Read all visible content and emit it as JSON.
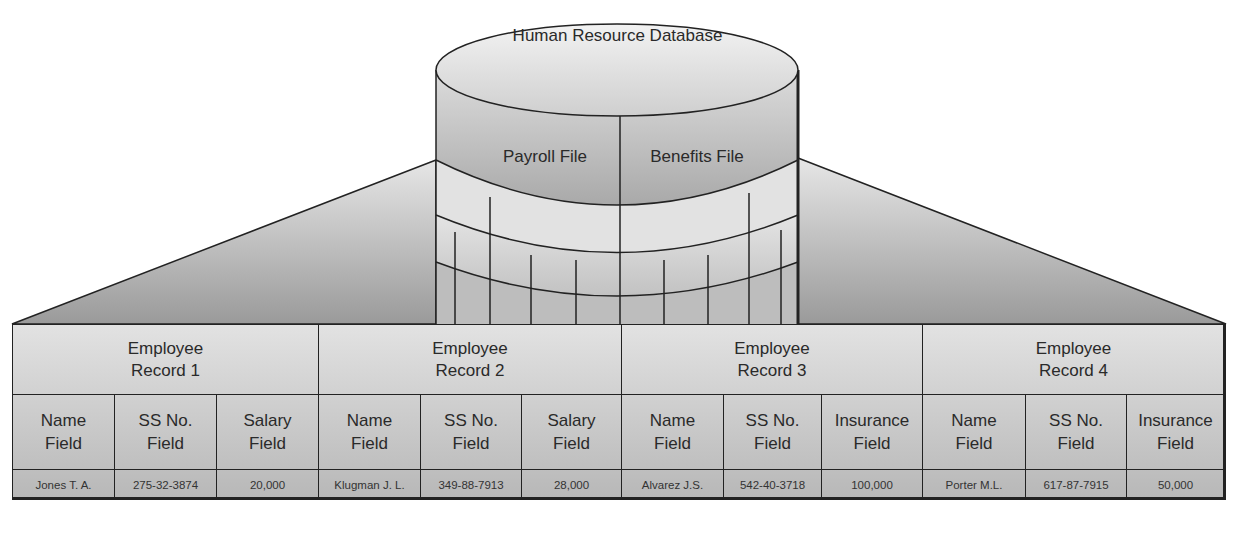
{
  "database": {
    "title": "Human Resource Database",
    "files": [
      {
        "label": "Payroll File"
      },
      {
        "label": "Benefits File"
      }
    ]
  },
  "records": [
    {
      "title_line1": "Employee",
      "title_line2": "Record 1",
      "fields": [
        {
          "line1": "Name",
          "line2": "Field",
          "value": "Jones  T. A."
        },
        {
          "line1": "SS No.",
          "line2": "Field",
          "value": "275-32-3874"
        },
        {
          "line1": "Salary",
          "line2": "Field",
          "value": "20,000"
        }
      ]
    },
    {
      "title_line1": "Employee",
      "title_line2": "Record 2",
      "fields": [
        {
          "line1": "Name",
          "line2": "Field",
          "value": "Klugman  J. L."
        },
        {
          "line1": "SS No.",
          "line2": "Field",
          "value": "349-88-7913"
        },
        {
          "line1": "Salary",
          "line2": "Field",
          "value": "28,000"
        }
      ]
    },
    {
      "title_line1": "Employee",
      "title_line2": "Record 3",
      "fields": [
        {
          "line1": "Name",
          "line2": "Field",
          "value": "Alvarez  J.S."
        },
        {
          "line1": "SS No.",
          "line2": "Field",
          "value": "542-40-3718"
        },
        {
          "line1": "Insurance",
          "line2": "Field",
          "value": "100,000"
        }
      ]
    },
    {
      "title_line1": "Employee",
      "title_line2": "Record 4",
      "fields": [
        {
          "line1": "Name",
          "line2": "Field",
          "value": "Porter  M.L."
        },
        {
          "line1": "SS No.",
          "line2": "Field",
          "value": "617-87-7915"
        },
        {
          "line1": "Insurance",
          "line2": "Field",
          "value": "50,000"
        }
      ]
    }
  ]
}
